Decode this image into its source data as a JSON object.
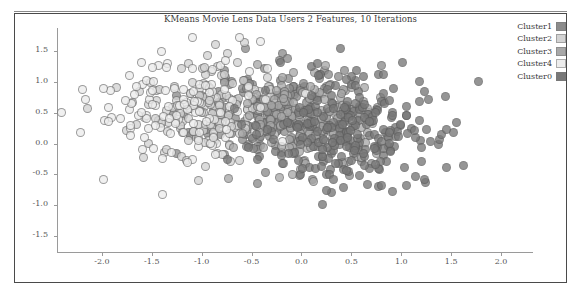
{
  "figure": {
    "title": "KMeans Movie Lens Data Users 2 Features, 10 Iterations",
    "background_color": "#ffffff",
    "frame_color": "#4a4a4a",
    "axis_color": "#9a9a9a",
    "tick_label_color": "#565656"
  },
  "legend": {
    "position": "top-right",
    "items": [
      {
        "label": "Cluster1",
        "color": "#8c8c8c"
      },
      {
        "label": "Cluster2",
        "color": "#d3d3d3"
      },
      {
        "label": "Cluster3",
        "color": "#a8a8a8"
      },
      {
        "label": "Cluster4",
        "color": "#ededed"
      },
      {
        "label": "Cluster0",
        "color": "#787878"
      }
    ]
  },
  "chart_data": {
    "type": "scatter",
    "title": "KMeans Movie Lens Data Users 2 Features, 10 Iterations",
    "xlabel": "",
    "ylabel": "",
    "xlim": [
      -2.45,
      2.32
    ],
    "ylim": [
      -1.78,
      1.88
    ],
    "grid": false,
    "legend_position": "top-right",
    "marker": {
      "shape": "circle",
      "size_px": 9,
      "edge_color": "#5a5a5a",
      "alpha": 0.78
    },
    "xticks": [
      -2.0,
      -1.5,
      -1.0,
      -0.5,
      0.0,
      0.5,
      1.0,
      1.5,
      2.0
    ],
    "xtick_labels": [
      "-2.0",
      "-1.5",
      "-1.0",
      "-0.5",
      "0.0",
      "0.5",
      "1.0",
      "1.5",
      "2.0"
    ],
    "yticks": [
      1.5,
      1.0,
      0.5,
      0.0,
      -0.5,
      -1.0,
      -1.5
    ],
    "ytick_labels": [
      "1.5",
      "1.0",
      "0.5",
      "0.0",
      "-0.5",
      "-1.0",
      "-1.5"
    ],
    "series": [
      {
        "name": "Cluster1",
        "color": "#8c8c8c",
        "n": 210,
        "center": [
          -0.3,
          0.46
        ],
        "spread": [
          0.42,
          0.38
        ],
        "seed": 17
      },
      {
        "name": "Cluster2",
        "color": "#d3d3d3",
        "n": 150,
        "center": [
          -0.95,
          0.58
        ],
        "spread": [
          0.4,
          0.44
        ],
        "seed": 43
      },
      {
        "name": "Cluster3",
        "color": "#a8a8a8",
        "n": 175,
        "center": [
          0.12,
          0.3
        ],
        "spread": [
          0.4,
          0.42
        ],
        "seed": 71
      },
      {
        "name": "Cluster4",
        "color": "#ededed",
        "n": 120,
        "center": [
          -1.3,
          0.6
        ],
        "spread": [
          0.48,
          0.5
        ],
        "seed": 95
      },
      {
        "name": "Cluster0",
        "color": "#787878",
        "n": 255,
        "center": [
          0.52,
          0.18
        ],
        "spread": [
          0.46,
          0.44
        ],
        "seed": 129
      }
    ]
  }
}
